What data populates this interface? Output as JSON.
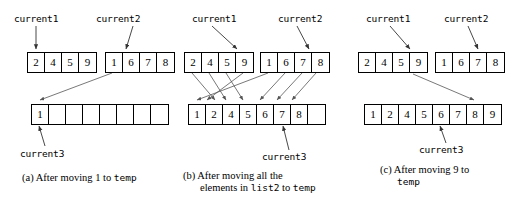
{
  "figure": {
    "pointer_labels": {
      "current1": "current1",
      "current2": "current2",
      "current3": "current3"
    },
    "panels": [
      {
        "id": "a",
        "label_current1": "current1",
        "label_current2": "current2",
        "label_current3": "current3",
        "list1": [
          "2",
          "4",
          "5",
          "9"
        ],
        "list2": [
          "1",
          "6",
          "7",
          "8"
        ],
        "temp": [
          "1",
          "",
          "",
          "",
          "",
          "",
          "",
          ""
        ],
        "current1_index": 0,
        "current2_index": 1,
        "current3_index": 0,
        "caption_prefix": "(a) After moving 1 to ",
        "caption_mono": "temp",
        "caption_line2": "",
        "caption_line2_mono": ""
      },
      {
        "id": "b",
        "label_current1": "current1",
        "label_current2": "current2",
        "label_current3": "current3",
        "list1": [
          "2",
          "4",
          "5",
          "9"
        ],
        "list2": [
          "1",
          "6",
          "7",
          "8"
        ],
        "temp": [
          "1",
          "2",
          "4",
          "5",
          "6",
          "7",
          "8",
          ""
        ],
        "current1_index": 3,
        "current2_index": 3,
        "current3_index": 6,
        "caption_prefix": "(b) After moving all the",
        "caption_mono": "",
        "caption_line2_a": "elements in ",
        "caption_line2_mono": "list2",
        "caption_line2_b": " to ",
        "caption_line2_mono2": "temp"
      },
      {
        "id": "c",
        "label_current1": "current1",
        "label_current2": "current2",
        "label_current3": "current3",
        "list1": [
          "2",
          "4",
          "5",
          "9"
        ],
        "list2": [
          "1",
          "6",
          "7",
          "8"
        ],
        "temp": [
          "1",
          "2",
          "4",
          "5",
          "6",
          "7",
          "8",
          "9"
        ],
        "current1_index": 3,
        "current2_index": 3,
        "current3_index": 7,
        "caption_prefix": "(c) After moving 9 to",
        "caption_mono": "",
        "caption_line2_mono": "temp"
      }
    ]
  },
  "colors": {
    "stroke": "#555555",
    "box_border": "#000000",
    "background": "#ffffff"
  }
}
